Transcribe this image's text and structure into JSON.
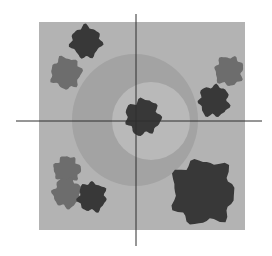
{
  "figure": {
    "colors": {
      "background": "#ffffff",
      "field": "#b3b3b3",
      "outer_ring": "#a3a3a3",
      "inner_disc": "#b9b9b9",
      "dark_blob": "#383838",
      "gray_blob": "#6d6d6d",
      "axis": "#2e2e2e"
    },
    "field": {
      "x": 39,
      "y": 22,
      "w": 206,
      "h": 208
    },
    "outer_ring": {
      "cx": 135,
      "cy": 120,
      "rx": 63,
      "ry": 66
    },
    "inner_disc": {
      "cx": 151,
      "cy": 121,
      "rx": 39,
      "ry": 39
    },
    "h_axis": {
      "x1": 16,
      "x2": 262,
      "y": 121
    },
    "v_axis": {
      "x": 136,
      "y1": 14,
      "y2": 246
    },
    "blobs": [
      {
        "name": "top-left-dark",
        "tone": "dark",
        "cx": 86,
        "cy": 42,
        "r": 15
      },
      {
        "name": "left-gray",
        "tone": "gray",
        "cx": 66,
        "cy": 73,
        "r": 15
      },
      {
        "name": "right-upper-gray",
        "tone": "gray",
        "cx": 229,
        "cy": 71,
        "r": 14
      },
      {
        "name": "right-dark",
        "tone": "dark",
        "cx": 214,
        "cy": 101,
        "r": 15
      },
      {
        "name": "center-dark",
        "tone": "dark",
        "cx": 143,
        "cy": 117,
        "r": 17
      },
      {
        "name": "lower-left-gray-top",
        "tone": "gray",
        "cx": 67,
        "cy": 170,
        "r": 13
      },
      {
        "name": "lower-left-gray-bottom",
        "tone": "gray",
        "cx": 67,
        "cy": 193,
        "r": 14
      },
      {
        "name": "lower-left-dark",
        "tone": "dark",
        "cx": 92,
        "cy": 197,
        "r": 14
      },
      {
        "name": "lower-right-dark",
        "tone": "dark",
        "cx": 203,
        "cy": 192,
        "r": 31
      }
    ]
  }
}
